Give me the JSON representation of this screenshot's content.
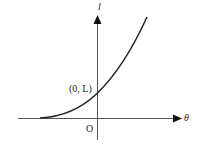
{
  "diagram": {
    "type": "function-graph",
    "axes": {
      "x_label": "θ",
      "y_label": "l",
      "origin_label": "O"
    },
    "annotations": {
      "intercept_label": "(0, L)"
    },
    "curve": {
      "description": "increasing convex curve crossing the vertical axis at (0, L)"
    },
    "colors": {
      "stroke": "#222222",
      "axis": "#444444",
      "background": "#ffffff"
    }
  }
}
